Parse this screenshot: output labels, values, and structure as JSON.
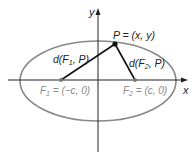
{
  "diagram": {
    "axes": {
      "x_label": "x",
      "y_label": "y"
    },
    "point_p": {
      "label": "P = (x, y)"
    },
    "focus_1": {
      "label_prefix": "F",
      "label_sub": "1",
      "label_suffix": " = (−c, 0)"
    },
    "focus_2": {
      "label_prefix": "F",
      "label_sub": "2",
      "label_suffix": " = (c, 0)"
    },
    "distance_1": {
      "label_prefix": "d(F",
      "label_sub": "1",
      "label_suffix": ", P)"
    },
    "distance_2": {
      "label_prefix": "d(F",
      "label_sub": "2",
      "label_suffix": ", P)"
    },
    "colors": {
      "ellipse": "#888888",
      "axes": "#222222",
      "segments": "#111111",
      "focus_label": "#8a8a8a"
    }
  }
}
